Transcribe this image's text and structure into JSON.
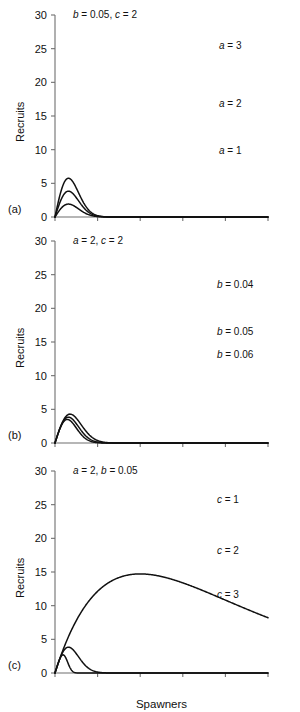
{
  "figure": {
    "axis_label_y": "Recruits",
    "axis_label_x": "Spawners",
    "panel_letters": [
      "(a)",
      "(b)",
      "(c)"
    ]
  },
  "chart_data": [
    {
      "type": "line",
      "panel": "(a)",
      "title": "b = 0.05, c = 2",
      "annotation_parts": [
        {
          "text": "b",
          "italic": true
        },
        {
          "text": " = 0.05, ",
          "italic": false
        },
        {
          "text": "c",
          "italic": true
        },
        {
          "text": " = 2",
          "italic": false
        }
      ],
      "xlabel": "Spawners",
      "ylabel": "Recruits",
      "xlim": [
        0,
        50
      ],
      "ylim": [
        0,
        30
      ],
      "xticks": [
        0,
        10,
        20,
        30,
        40,
        50
      ],
      "yticks": [
        0,
        5,
        10,
        15,
        20,
        25,
        30
      ],
      "xticklabels": [
        "0",
        "10",
        "20",
        "30",
        "40",
        "50"
      ],
      "yticklabels": [
        "0",
        "5",
        "10",
        "15",
        "20",
        "25",
        "30"
      ],
      "grid": false,
      "legend_position": "inline-right",
      "model": "R = a * S * exp(-b * S^c)",
      "fixed_params": {
        "b": 0.05,
        "c": 2
      },
      "series": [
        {
          "name": "a = 3",
          "label_parts": [
            {
              "text": "a",
              "italic": true
            },
            {
              "text": " = 3",
              "italic": false
            }
          ],
          "params": {
            "a": 3,
            "b": 0.05,
            "c": 2
          },
          "label_x": 38.5,
          "label_y": 25.0,
          "x": [
            0,
            2,
            4,
            6,
            8,
            10,
            12,
            14,
            16,
            18,
            20,
            22,
            24,
            26,
            28,
            30,
            32,
            34,
            36,
            38,
            40,
            42,
            44,
            46,
            48,
            50
          ],
          "values": [
            0,
            5.88,
            11.09,
            15.3,
            18.38,
            20.46,
            21.71,
            22.34,
            22.53,
            22.44,
            22.17,
            21.8,
            21.38,
            20.93,
            20.48,
            20.04,
            19.61,
            19.19,
            18.79,
            18.4,
            18.03,
            17.67,
            17.32,
            16.98,
            16.66,
            20.5
          ]
        },
        {
          "name": "a = 2",
          "label_parts": [
            {
              "text": "a",
              "italic": true
            },
            {
              "text": " = 2",
              "italic": false
            }
          ],
          "params": {
            "a": 2,
            "b": 0.05,
            "c": 2
          },
          "label_x": 38.5,
          "label_y": 16.4,
          "x": [
            0,
            2,
            4,
            6,
            8,
            10,
            12,
            14,
            16,
            18,
            20,
            22,
            24,
            26,
            28,
            30,
            32,
            34,
            36,
            38,
            40,
            42,
            44,
            46,
            48,
            50
          ],
          "values": [
            0,
            3.92,
            7.39,
            10.2,
            12.25,
            13.64,
            14.47,
            14.89,
            15.02,
            14.96,
            14.78,
            14.53,
            14.25,
            13.95,
            13.65,
            13.36,
            13.07,
            12.79,
            12.52,
            12.27,
            12.02,
            11.78,
            11.55,
            11.32,
            11.11,
            13.7
          ]
        },
        {
          "name": "a = 1",
          "label_parts": [
            {
              "text": "a",
              "italic": true
            },
            {
              "text": " = 1",
              "italic": false
            }
          ],
          "params": {
            "a": 1,
            "b": 0.05,
            "c": 2
          },
          "label_x": 38.5,
          "label_y": 9.3,
          "x": [
            0,
            2,
            4,
            6,
            8,
            10,
            12,
            14,
            16,
            18,
            20,
            22,
            24,
            26,
            28,
            30,
            32,
            34,
            36,
            38,
            40,
            42,
            44,
            46,
            48,
            50
          ],
          "values": [
            0,
            1.96,
            3.7,
            5.1,
            6.13,
            6.82,
            7.24,
            7.45,
            7.51,
            7.48,
            7.39,
            7.27,
            7.13,
            6.98,
            6.82,
            6.68,
            6.54,
            6.4,
            6.26,
            6.13,
            6.01,
            5.89,
            5.77,
            5.66,
            5.55,
            6.8
          ]
        }
      ]
    },
    {
      "type": "line",
      "panel": "(b)",
      "title": "a = 2, c = 2",
      "annotation_parts": [
        {
          "text": "a",
          "italic": true
        },
        {
          "text": " = 2, ",
          "italic": false
        },
        {
          "text": "c",
          "italic": true
        },
        {
          "text": " = 2",
          "italic": false
        }
      ],
      "xlabel": "Spawners",
      "ylabel": "Recruits",
      "xlim": [
        0,
        50
      ],
      "ylim": [
        0,
        30
      ],
      "xticks": [
        0,
        10,
        20,
        30,
        40,
        50
      ],
      "yticks": [
        0,
        5,
        10,
        15,
        20,
        25,
        30
      ],
      "xticklabels": [
        "0",
        "10",
        "20",
        "30",
        "40",
        "50"
      ],
      "yticklabels": [
        "0",
        "5",
        "10",
        "15",
        "20",
        "25",
        "30"
      ],
      "grid": false,
      "legend_position": "inline-right",
      "model": "R = a * S * exp(-b * S^c)",
      "fixed_params": {
        "a": 2,
        "c": 2
      },
      "series": [
        {
          "name": "b = 0.04",
          "label_parts": [
            {
              "text": "b",
              "italic": true
            },
            {
              "text": " = 0.04",
              "italic": false
            }
          ],
          "params": {
            "a": 2,
            "b": 0.04,
            "c": 2
          },
          "label_x": 38.0,
          "label_y": 23.0,
          "x": [
            0,
            2,
            4,
            6,
            8,
            10,
            12,
            14,
            16,
            18,
            20,
            22,
            24,
            26,
            28,
            30,
            32,
            34,
            36,
            38,
            40,
            42,
            44,
            46,
            48,
            50
          ],
          "values": [
            0,
            4.0,
            7.5,
            10.5,
            13.0,
            15.0,
            16.5,
            17.6,
            18.3,
            18.8,
            19.0,
            19.0,
            18.9,
            18.7,
            18.4,
            18.0,
            17.6,
            17.2,
            16.8,
            16.4,
            16.0,
            15.6,
            15.3,
            14.9,
            14.6,
            19.9
          ]
        },
        {
          "name": "b = 0.05",
          "label_parts": [
            {
              "text": "b",
              "italic": true
            },
            {
              "text": " = 0.05",
              "italic": false
            }
          ],
          "params": {
            "a": 2,
            "b": 0.05,
            "c": 2
          },
          "label_x": 38.0,
          "label_y": 16.0,
          "x": [
            0,
            2,
            4,
            6,
            8,
            10,
            12,
            14,
            16,
            18,
            20,
            22,
            24,
            26,
            28,
            30,
            32,
            34,
            36,
            38,
            40,
            42,
            44,
            46,
            48,
            50
          ],
          "values": [
            0,
            3.92,
            7.39,
            10.2,
            12.25,
            13.64,
            14.47,
            14.89,
            15.02,
            14.96,
            14.78,
            14.53,
            14.25,
            13.95,
            13.65,
            13.36,
            13.07,
            12.79,
            12.52,
            12.27,
            12.02,
            11.78,
            11.55,
            11.32,
            11.11,
            13.7
          ]
        },
        {
          "name": "b = 0.06",
          "label_parts": [
            {
              "text": "b",
              "italic": true
            },
            {
              "text": " = 0.06",
              "italic": false
            }
          ],
          "params": {
            "a": 2,
            "b": 0.06,
            "c": 2
          },
          "label_x": 38.0,
          "label_y": 12.6,
          "x": [
            0,
            2,
            4,
            6,
            8,
            10,
            12,
            14,
            16,
            18,
            20,
            22,
            24,
            26,
            28,
            30,
            32,
            34,
            36,
            38,
            40,
            42,
            44,
            46,
            48,
            50
          ],
          "values": [
            0,
            3.8,
            7.0,
            9.6,
            11.4,
            12.5,
            13.1,
            13.3,
            13.2,
            13.0,
            12.7,
            12.4,
            12.1,
            11.8,
            11.5,
            11.2,
            10.9,
            10.7,
            10.4,
            10.2,
            10.0,
            9.8,
            9.6,
            9.4,
            9.3,
            9.6
          ]
        }
      ]
    },
    {
      "type": "line",
      "panel": "(c)",
      "title": "a = 2, b = 0.05",
      "annotation_parts": [
        {
          "text": "a",
          "italic": true
        },
        {
          "text": " = 2, ",
          "italic": false
        },
        {
          "text": "b",
          "italic": true
        },
        {
          "text": " = 0.05",
          "italic": false
        }
      ],
      "xlabel": "Spawners",
      "ylabel": "Recruits",
      "xlim": [
        0,
        50
      ],
      "ylim": [
        0,
        30
      ],
      "xticks": [
        0,
        10,
        20,
        30,
        40,
        50
      ],
      "yticks": [
        0,
        5,
        10,
        15,
        20,
        25,
        30
      ],
      "xticklabels": [
        "0",
        "10",
        "20",
        "30",
        "40",
        "50"
      ],
      "yticklabels": [
        "0",
        "5",
        "10",
        "15",
        "20",
        "25",
        "30"
      ],
      "grid": false,
      "legend_position": "inline-right",
      "model": "R = a * S * exp(-b * S^c)",
      "fixed_params": {
        "a": 2,
        "b": 0.05
      },
      "crossing_point": {
        "x": 20,
        "y": 20.4
      },
      "series": [
        {
          "name": "c = 1",
          "label_parts": [
            {
              "text": "c",
              "italic": true
            },
            {
              "text": " = 1",
              "italic": false
            }
          ],
          "params": {
            "a": 2,
            "b": 0.05,
            "c": 1
          },
          "label_x": 38.0,
          "label_y": 25.2,
          "x": [
            0,
            2,
            4,
            6,
            8,
            10,
            12,
            14,
            16,
            18,
            20,
            22,
            24,
            26,
            28,
            30,
            32,
            34,
            36,
            38,
            40,
            42,
            44,
            46,
            48,
            50
          ],
          "values": [
            0,
            3.8,
            7.3,
            10.5,
            13.4,
            16.0,
            18.4,
            20.5,
            22.4,
            24.1,
            25.6,
            26.9,
            28.1,
            29.1,
            30.0,
            30.7,
            31.3,
            31.8,
            32.2,
            32.5,
            32.7,
            32.8,
            32.8,
            32.8,
            32.7,
            28.8
          ]
        },
        {
          "name": "c = 2",
          "label_parts": [
            {
              "text": "c",
              "italic": true
            },
            {
              "text": " = 2",
              "italic": false
            }
          ],
          "params": {
            "a": 2,
            "b": 0.05,
            "c": 2
          },
          "label_x": 38.0,
          "label_y": 17.6,
          "x": [
            0,
            2,
            4,
            6,
            8,
            10,
            12,
            14,
            16,
            18,
            20,
            22,
            24,
            26,
            28,
            30,
            32,
            34,
            36,
            38,
            40,
            42,
            44,
            46,
            48,
            50
          ],
          "values": [
            0,
            3.92,
            7.39,
            10.2,
            12.25,
            13.64,
            14.47,
            14.89,
            15.02,
            14.96,
            14.78,
            14.53,
            14.25,
            13.95,
            13.65,
            13.36,
            13.07,
            12.79,
            12.52,
            12.27,
            12.02,
            11.78,
            11.55,
            11.32,
            11.11,
            14.1
          ]
        },
        {
          "name": "c = 3",
          "label_parts": [
            {
              "text": "c",
              "italic": true
            },
            {
              "text": " = 3",
              "italic": false
            }
          ],
          "params": {
            "a": 2,
            "b": 0.05,
            "c": 3
          },
          "label_x": 38.0,
          "label_y": 11.2,
          "x": [
            0,
            2,
            4,
            6,
            8,
            10,
            12,
            14,
            16,
            18,
            20,
            22,
            24,
            26,
            28,
            30,
            32,
            34,
            36,
            38,
            40,
            42,
            44,
            46,
            48,
            50
          ],
          "values": [
            0,
            3.9,
            7.4,
            10.3,
            12.6,
            14.3,
            15.5,
            16.2,
            16.5,
            16.4,
            16.0,
            15.4,
            14.6,
            13.7,
            12.8,
            11.8,
            10.9,
            10.0,
            9.2,
            8.5,
            7.9,
            7.4,
            7.0,
            6.7,
            6.4,
            6.2
          ]
        }
      ]
    }
  ]
}
